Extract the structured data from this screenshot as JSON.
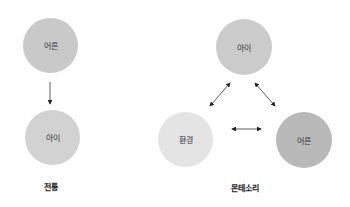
{
  "diagrams": [
    {
      "id": "traditional",
      "caption": "전통",
      "nodes": [
        {
          "label": "어른",
          "color": "#c9c9c9"
        },
        {
          "label": "아이",
          "color": "#d2d2d2"
        }
      ],
      "edges": [
        {
          "from": "어른",
          "to": "아이",
          "type": "one-way"
        }
      ]
    },
    {
      "id": "montessori",
      "caption": "몬테소리",
      "nodes": [
        {
          "label": "아이",
          "color": "#cbcbcb"
        },
        {
          "label": "환경",
          "color": "#e4e4e4"
        },
        {
          "label": "어른",
          "color": "#b9b9b9"
        }
      ],
      "edges": [
        {
          "from": "아이",
          "to": "환경",
          "type": "two-way"
        },
        {
          "from": "아이",
          "to": "어른",
          "type": "two-way"
        },
        {
          "from": "환경",
          "to": "어른",
          "type": "two-way"
        }
      ]
    }
  ]
}
